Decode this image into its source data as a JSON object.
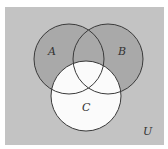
{
  "diagram": {
    "type": "venn",
    "colors": {
      "universe": "#c3c3c3",
      "shaded": "#a9a9a9",
      "unshaded": "#fbfbfb",
      "stroke": "#3a3a3a"
    },
    "sets": [
      {
        "label": "A",
        "cx": 69,
        "cy": 59,
        "r": 35
      },
      {
        "label": "B",
        "cx": 108,
        "cy": 59,
        "r": 35
      },
      {
        "label": "C",
        "cx": 86,
        "cy": 96,
        "r": 35
      }
    ],
    "universe_label": "U",
    "shaded_region": "(A ∪ B) − C"
  }
}
